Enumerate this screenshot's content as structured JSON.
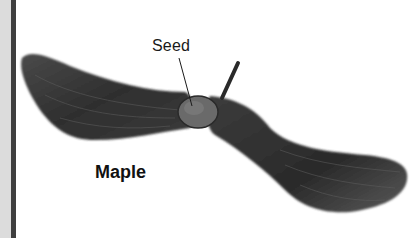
{
  "figure": {
    "labels": {
      "seed": "Seed",
      "species": "Maple"
    }
  },
  "colors": {
    "left_strip": "#dcdcdc",
    "left_bar": "#3f3f3f",
    "wing_dark": "#2e2e2e",
    "wing_mid": "#555555",
    "seed_body": "#6a6a6a",
    "background": "#ffffff"
  }
}
